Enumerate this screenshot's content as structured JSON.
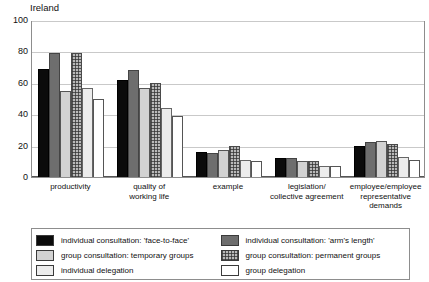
{
  "chart_data": {
    "type": "bar",
    "title": "Ireland",
    "xlabel": "",
    "ylabel": "",
    "ylim": [
      0,
      100
    ],
    "yticks": [
      0,
      20,
      40,
      60,
      80,
      100
    ],
    "grid": true,
    "legend_position": "bottom",
    "categories": [
      "productivity",
      "quality of working life",
      "example",
      "legislation/ collective agreement",
      "employee/employee representative demands"
    ],
    "category_lines": [
      [
        "productivity"
      ],
      [
        "quality of",
        "working life"
      ],
      [
        "example"
      ],
      [
        "legislation/",
        "collective agreement"
      ],
      [
        "employee/employee",
        "representative",
        "demands"
      ]
    ],
    "series": [
      {
        "name": "individual consultation: 'face-to-face'",
        "values": [
          69,
          62,
          16,
          12,
          20
        ]
      },
      {
        "name": "individual consultation: 'arm's length'",
        "values": [
          79,
          68,
          15,
          12,
          22
        ]
      },
      {
        "name": "group consultation: temporary groups",
        "values": [
          55,
          57,
          17,
          10,
          23
        ]
      },
      {
        "name": "group consultation: permanent groups",
        "values": [
          79,
          60,
          20,
          10,
          21
        ]
      },
      {
        "name": "individual delegation",
        "values": [
          57,
          44,
          11,
          7,
          13
        ]
      },
      {
        "name": "group delegation",
        "values": [
          50,
          39,
          10,
          7,
          11
        ]
      }
    ]
  },
  "legend": {
    "items": [
      {
        "label": "individual consultation: 'face-to-face'",
        "swatch": "solid-black"
      },
      {
        "label": "individual consultation: 'arm's length'",
        "swatch": "solid-gray"
      },
      {
        "label": "group consultation: temporary groups",
        "swatch": "light-gray"
      },
      {
        "label": "group consultation: permanent groups",
        "swatch": "checkered"
      },
      {
        "label": "individual delegation",
        "swatch": "very-light-gray"
      },
      {
        "label": "group delegation",
        "swatch": "white"
      }
    ],
    "column_order": [
      0,
      2,
      4,
      1,
      3,
      5
    ]
  },
  "colors": {
    "series_0": "#0b0b0b",
    "series_1": "#6e6e6e",
    "series_2": "#d2d2d2",
    "series_3": "#b9b9b9",
    "series_4": "#ececec",
    "series_5": "#ffffff",
    "frame": "#8d8d8d",
    "gridline": "#c9c9c9",
    "text": "#111111"
  }
}
